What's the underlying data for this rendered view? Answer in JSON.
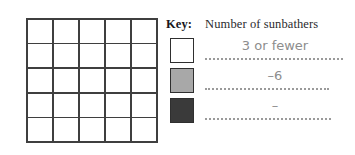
{
  "chart_data": {
    "type": "table",
    "title": "Number of sunbathers",
    "grid": {
      "rows": 5,
      "columns": 5,
      "cells": [
        [
          "",
          "",
          "",
          "",
          ""
        ],
        [
          "",
          "",
          "",
          "",
          ""
        ],
        [
          "",
          "",
          "",
          "",
          ""
        ],
        [
          "",
          "",
          "",
          "",
          ""
        ],
        [
          "",
          "",
          "",
          "",
          ""
        ]
      ]
    },
    "legend_position": "right",
    "categories": [
      "3 or fewer",
      "–6",
      "–"
    ],
    "colors": [
      "#ffffff",
      "#a8a8a8",
      "#3a3a3a"
    ]
  },
  "key": {
    "label": "Key:",
    "title": "Number of sunbathers",
    "rows": [
      {
        "swatch_color": "#ffffff",
        "answer": "3 or fewer"
      },
      {
        "swatch_color": "#a8a8a8",
        "answer": "–6"
      },
      {
        "swatch_color": "#3a3a3a",
        "answer": "–"
      }
    ]
  },
  "grid": {
    "rows": 5,
    "columns": 5
  }
}
